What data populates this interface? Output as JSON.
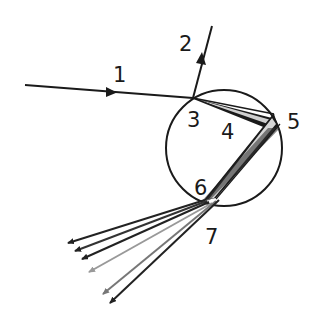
{
  "diagram": {
    "type": "light-ray-through-droplet",
    "labels": [
      {
        "id": "1",
        "text": "1",
        "x": 113,
        "y": 82
      },
      {
        "id": "2",
        "text": "2",
        "x": 179,
        "y": 51
      },
      {
        "id": "3",
        "text": "3",
        "x": 187,
        "y": 127
      },
      {
        "id": "4",
        "text": "4",
        "x": 221,
        "y": 139
      },
      {
        "id": "5",
        "text": "5",
        "x": 287,
        "y": 129
      },
      {
        "id": "6",
        "text": "6",
        "x": 194,
        "y": 195
      },
      {
        "id": "7",
        "text": "7",
        "x": 205,
        "y": 244
      }
    ],
    "circle": {
      "cx": 224,
      "cy": 148,
      "r": 58,
      "stroke": "#1a1a1a"
    },
    "incident_ray": {
      "x1": 25,
      "y1": 85,
      "x2": 193,
      "y2": 98,
      "arrow_at": [
        111,
        92
      ]
    },
    "reflected_ray": {
      "x1": 193,
      "y1": 98,
      "x2": 212,
      "y2": 26,
      "arrow_at": [
        201,
        60
      ]
    },
    "exit_rays": [
      {
        "x2": 68,
        "y2": 243,
        "color": "#222222"
      },
      {
        "x2": 75,
        "y2": 251,
        "color": "#333333"
      },
      {
        "x2": 82,
        "y2": 259,
        "color": "#222222"
      },
      {
        "x2": 89,
        "y2": 272,
        "color": "#999999"
      },
      {
        "x2": 103,
        "y2": 294,
        "color": "#777777"
      },
      {
        "x2": 110,
        "y2": 303,
        "color": "#222222"
      }
    ],
    "colors": {
      "ink": "#1a1a1a",
      "grey_ray": "#999999",
      "highlight": "#cccccc"
    }
  }
}
